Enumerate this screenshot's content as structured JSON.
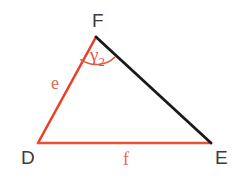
{
  "figure": {
    "type": "triangle",
    "name": "triangle-DEF",
    "background_color": "#ffffff",
    "width": 235,
    "height": 182
  },
  "colors": {
    "red_side": "#e8412a",
    "red_base": "#e8503c",
    "black_side": "#1a1a1a",
    "arc": "#e2563d",
    "vertex_label": "#3b3b3b",
    "side_label": "#e2674e",
    "angle_label": "#e2563d"
  },
  "vertices": [
    {
      "id": "F",
      "label": "F",
      "x": 96,
      "y": 37,
      "label_x": 92,
      "label_y": 11
    },
    {
      "id": "D",
      "label": "D",
      "x": 38,
      "y": 143,
      "label_x": 21,
      "label_y": 148
    },
    {
      "id": "E",
      "label": "E",
      "x": 211,
      "y": 143,
      "label_x": 215,
      "label_y": 148
    }
  ],
  "sides": [
    {
      "id": "e",
      "label": "e",
      "from": "D",
      "to": "F",
      "color": "#e8412a",
      "stroke_width": 2.6,
      "label_x": 51,
      "label_y": 74
    },
    {
      "id": "f",
      "label": "f",
      "from": "D",
      "to": "E",
      "color": "#e8503c",
      "stroke_width": 2.6,
      "label_x": 123,
      "label_y": 150
    },
    {
      "id": "FE",
      "label": "",
      "from": "F",
      "to": "E",
      "color": "#1a1a1a",
      "stroke_width": 2.8,
      "label_x": 0,
      "label_y": 0
    }
  ],
  "angles": [
    {
      "id": "gamma2",
      "vertex": "F",
      "label": "γ",
      "subscript": "2",
      "color": "#e2563d",
      "arc_radius": 27,
      "label_x": 90,
      "label_y": 45
    }
  ],
  "geometry_paths": {
    "side_e": "M 38 143 L 96 37",
    "side_f": "M 38 143 L 211 143",
    "side_FE": "M 96 37 L 211 143",
    "angle_arc": "M 80.8 59.6 A 27 27 0 0 0 114.7 57.4"
  }
}
